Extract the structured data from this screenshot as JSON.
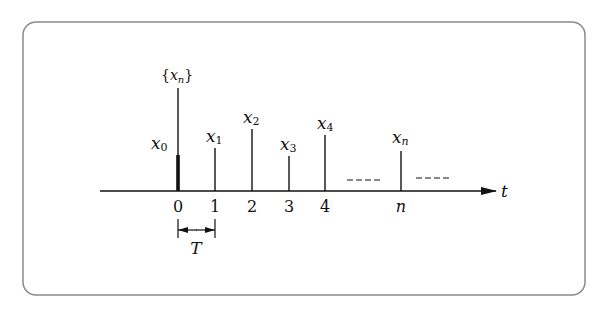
{
  "figure": {
    "sequence_label": {
      "open": "{",
      "var": "x",
      "sub": "n",
      "close": "}"
    },
    "axis_label": "t",
    "tick_labels": [
      "0",
      "1",
      "2",
      "3",
      "4",
      "n"
    ],
    "sample_labels": [
      {
        "var": "x",
        "sub": "0"
      },
      {
        "var": "x",
        "sub": "1"
      },
      {
        "var": "x",
        "sub": "2"
      },
      {
        "var": "x",
        "sub": "3"
      },
      {
        "var": "x",
        "sub": "4"
      },
      {
        "var": "x",
        "sub": "n"
      }
    ],
    "ellipsis": [
      "----",
      "----"
    ],
    "period_label": "T",
    "colors": {
      "stroke": "#111111",
      "frame": "#8a8a8a",
      "background": "#ffffff"
    }
  }
}
